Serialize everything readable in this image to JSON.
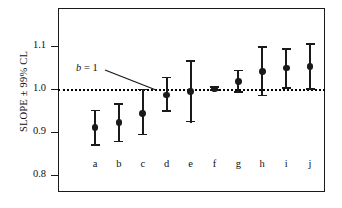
{
  "chart_data": {
    "type": "scatter",
    "title": "",
    "xlabel": "",
    "ylabel": "SLOPE ± 99% CL",
    "ylim": [
      0.77,
      1.155
    ],
    "yticks": [
      0.8,
      0.9,
      1.0,
      1.1
    ],
    "ytick_labels": [
      "0.8",
      "0.9",
      "1.0",
      "1.1"
    ],
    "grid": false,
    "legend": "none",
    "reference_line": {
      "value": 1.0,
      "style": "dotted",
      "label": "b = 1",
      "label_italic_part": "b",
      "label_rest": " = 1"
    },
    "categories": [
      "a",
      "b",
      "c",
      "d",
      "e",
      "f",
      "g",
      "h",
      "i",
      "j"
    ],
    "values": [
      0.91,
      0.922,
      0.943,
      0.986,
      0.995,
      1.0,
      1.018,
      1.041,
      1.049,
      1.052
    ],
    "ci_low": [
      0.867,
      0.876,
      0.892,
      0.947,
      0.922,
      0.995,
      0.991,
      0.983,
      1.0,
      0.998
    ],
    "ci_high": [
      0.952,
      0.967,
      1.001,
      1.029,
      1.068,
      1.006,
      1.045,
      1.1,
      1.095,
      1.106
    ],
    "error_label": "99% CL"
  },
  "colors": {
    "marker": "#1a1a1a",
    "frame": "#1a1a1a",
    "reference": "#000000",
    "background": "#ffffff"
  }
}
